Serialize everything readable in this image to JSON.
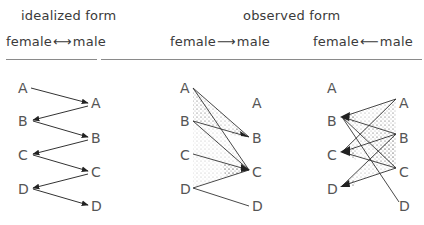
{
  "headers": {
    "idealized_title": "idealized form",
    "observed_title": "observed form",
    "panel1_caption": "female ⟷ male",
    "panel2_caption": "female ⟶ male",
    "panel3_caption": "female ⟵ male",
    "panel1_caption_left": "female",
    "panel1_caption_arrow": "⟷",
    "panel1_caption_right": "male",
    "panel2_caption_left": "female",
    "panel2_caption_arrow": "⟶",
    "panel2_caption_right": "male",
    "panel3_caption_left": "female",
    "panel3_caption_arrow": "⟵",
    "panel3_caption_right": "male"
  },
  "panels": [
    {
      "name": "idealized",
      "left_labels": [
        "A",
        "B",
        "C",
        "D"
      ],
      "right_labels": [
        "A",
        "B",
        "C",
        "D"
      ],
      "connections": [
        {
          "from": "L:A",
          "to": "R:A",
          "arrow": "to"
        },
        {
          "from": "R:A",
          "to": "L:B",
          "arrow": "to"
        },
        {
          "from": "L:B",
          "to": "R:B",
          "arrow": "to"
        },
        {
          "from": "R:B",
          "to": "L:C",
          "arrow": "to"
        },
        {
          "from": "L:C",
          "to": "R:C",
          "arrow": "to"
        },
        {
          "from": "R:C",
          "to": "L:D",
          "arrow": "to"
        },
        {
          "from": "L:D",
          "to": "R:D",
          "arrow": "to"
        }
      ]
    },
    {
      "name": "observed-female-to-male",
      "left_labels": [
        "A",
        "B",
        "C",
        "D"
      ],
      "right_labels": [
        "A",
        "B",
        "C",
        "D"
      ],
      "connections": [
        {
          "from": "L:A",
          "to": "R:B"
        },
        {
          "from": "L:A",
          "to": "R:C"
        },
        {
          "from": "L:B",
          "to": "R:B"
        },
        {
          "from": "L:B",
          "to": "R:C"
        },
        {
          "from": "L:C",
          "to": "R:C"
        },
        {
          "from": "L:D",
          "to": "R:C"
        },
        {
          "from": "L:D",
          "to": "R:D"
        }
      ],
      "converging_nodes": [
        "R:B",
        "R:C"
      ]
    },
    {
      "name": "observed-female-from-male",
      "left_labels": [
        "A",
        "B",
        "C",
        "D"
      ],
      "right_labels": [
        "A",
        "B",
        "C",
        "D"
      ],
      "connections": [
        {
          "from": "R:A",
          "to": "L:B"
        },
        {
          "from": "R:B",
          "to": "L:B"
        },
        {
          "from": "R:C",
          "to": "L:B"
        },
        {
          "from": "L:B",
          "to": "R:D"
        },
        {
          "from": "R:A",
          "to": "L:C"
        },
        {
          "from": "R:B",
          "to": "L:C"
        },
        {
          "from": "R:C",
          "to": "L:C"
        },
        {
          "from": "R:B",
          "to": "L:D"
        },
        {
          "from": "R:C",
          "to": "L:D"
        }
      ],
      "converging_nodes": [
        "L:B",
        "L:C",
        "L:D"
      ]
    }
  ],
  "colors": {
    "text": "#444444",
    "line": "#333333",
    "rule": "#8a8a8a",
    "background": "#ffffff"
  }
}
